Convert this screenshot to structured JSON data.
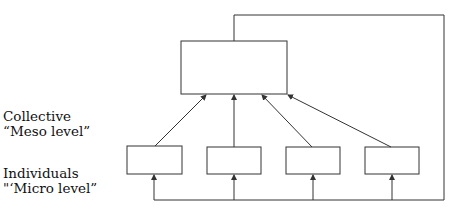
{
  "labels": {
    "collective": {
      "line1": "Collective",
      "line2": "“Meso level”"
    },
    "individuals": {
      "line1": "Individuals",
      "line2": "\"‘Micro level”"
    }
  },
  "nodes": {
    "collective_box": {
      "x": 181,
      "y": 41,
      "w": 106,
      "h": 53
    },
    "individual_boxes": [
      {
        "x": 127,
        "y": 146,
        "w": 55,
        "h": 28
      },
      {
        "x": 207,
        "y": 147,
        "w": 54,
        "h": 27
      },
      {
        "x": 286,
        "y": 147,
        "w": 54,
        "h": 27
      },
      {
        "x": 365,
        "y": 147,
        "w": 54,
        "h": 27
      }
    ]
  },
  "colors": {
    "stroke": "#333333"
  }
}
